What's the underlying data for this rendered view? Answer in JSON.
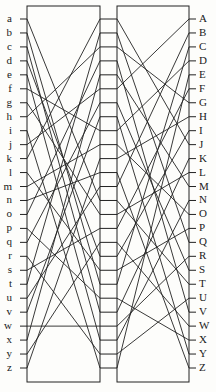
{
  "diagram": {
    "type": "two-stage-scrambler",
    "stroke_color": "#222222",
    "background_color": "#fdfdfb",
    "label_color": "#1a1a1a",
    "left_labels": [
      "a",
      "b",
      "c",
      "d",
      "e",
      "f",
      "g",
      "h",
      "i",
      "j",
      "k",
      "l",
      "m",
      "n",
      "o",
      "p",
      "q",
      "r",
      "s",
      "t",
      "u",
      "v",
      "w",
      "x",
      "y",
      "z"
    ],
    "right_labels": [
      "A",
      "B",
      "C",
      "D",
      "E",
      "F",
      "G",
      "H",
      "I",
      "J",
      "K",
      "L",
      "M",
      "N",
      "O",
      "P",
      "Q",
      "R",
      "S",
      "T",
      "U",
      "V",
      "W",
      "X",
      "Y",
      "Z"
    ],
    "geometry": {
      "width": 216,
      "height": 392,
      "left_box": {
        "x": 27,
        "y": 6,
        "w": 73,
        "h": 376
      },
      "right_box": {
        "x": 117,
        "y": 6,
        "w": 72,
        "h": 376
      },
      "first_row_y": 19,
      "row_spacing": 13.96,
      "rows": 26,
      "tick_length": 7,
      "left_label_x": 12,
      "right_label_x": 199
    },
    "middle_connectors": {
      "count": 26,
      "from_x": 100,
      "to_x": 117,
      "description": "26 straight horizontal rungs linking left box output contacts to right box input contacts"
    },
    "left_stage_wiring": [
      [
        0,
        13
      ],
      [
        1,
        19
      ],
      [
        2,
        21
      ],
      [
        3,
        17
      ],
      [
        4,
        23
      ],
      [
        5,
        8
      ],
      [
        6,
        14
      ],
      [
        7,
        2
      ],
      [
        8,
        25
      ],
      [
        9,
        5
      ],
      [
        10,
        0
      ],
      [
        11,
        18
      ],
      [
        12,
        9
      ],
      [
        13,
        11
      ],
      [
        14,
        3
      ],
      [
        15,
        20
      ],
      [
        16,
        6
      ],
      [
        17,
        24
      ],
      [
        18,
        15
      ],
      [
        19,
        1
      ],
      [
        20,
        12
      ],
      [
        21,
        7
      ],
      [
        22,
        22
      ],
      [
        23,
        4
      ],
      [
        24,
        16
      ],
      [
        25,
        10
      ]
    ],
    "right_stage_wiring": [
      [
        0,
        9
      ],
      [
        1,
        16
      ],
      [
        2,
        6
      ],
      [
        3,
        21
      ],
      [
        4,
        12
      ],
      [
        5,
        0
      ],
      [
        6,
        18
      ],
      [
        7,
        24
      ],
      [
        8,
        3
      ],
      [
        9,
        14
      ],
      [
        10,
        7
      ],
      [
        11,
        25
      ],
      [
        12,
        1
      ],
      [
        13,
        19
      ],
      [
        14,
        11
      ],
      [
        15,
        5
      ],
      [
        16,
        22
      ],
      [
        17,
        8
      ],
      [
        18,
        15
      ],
      [
        19,
        2
      ],
      [
        20,
        23
      ],
      [
        21,
        10
      ],
      [
        22,
        17
      ],
      [
        23,
        13
      ],
      [
        24,
        20
      ],
      [
        25,
        4
      ]
    ]
  }
}
